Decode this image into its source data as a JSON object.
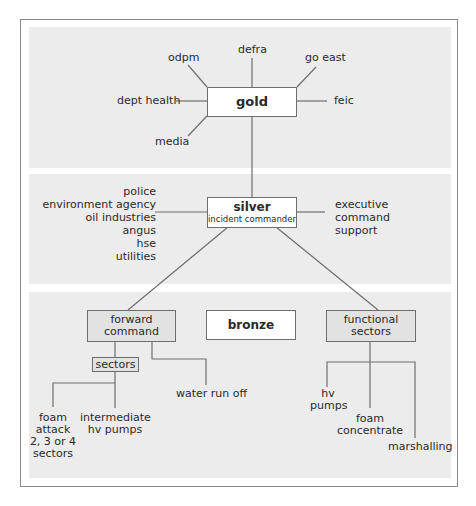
{
  "gold": {
    "title": "gold",
    "connections": {
      "top_left": "odpm",
      "top": "defra",
      "top_right": "go east",
      "left": "dept health",
      "right": "feic",
      "bottom_left": "media"
    }
  },
  "silver": {
    "title": "silver",
    "subtitle": "incident commander",
    "left_list": [
      "police",
      "environment agency",
      "oil industries",
      "angus",
      "hse",
      "utilities"
    ],
    "right_list": [
      "executive",
      "command",
      "support"
    ]
  },
  "bronze": {
    "title": "bronze",
    "forward_command": {
      "label_line1": "forward",
      "label_line2": "command",
      "sectors_label": "sectors",
      "water_run_off": "water run off",
      "foam_attack": [
        "foam",
        "attack",
        "2, 3 or 4",
        "sectors"
      ],
      "intermediate": [
        "intermediate",
        "hv pumps"
      ]
    },
    "functional_sectors": {
      "label_line1": "functional",
      "label_line2": "sectors",
      "hv_pumps": [
        "hv",
        "pumps"
      ],
      "foam_concentrate": [
        "foam",
        "concentrate"
      ],
      "marshalling": "marshalling"
    }
  },
  "colors": {
    "band_fill": "#ececec",
    "line": "#6e6e6e",
    "frame": "#8a8a8a",
    "grey_box": "#e2e2e2"
  }
}
